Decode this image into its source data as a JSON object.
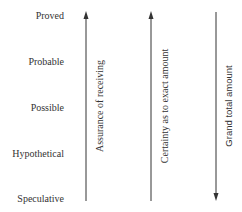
{
  "levels": [
    "Proved",
    "Probable",
    "Possible",
    "Hypothetical",
    "Speculative"
  ],
  "axes": [
    {
      "label": "Assurance of receiving",
      "direction": "up"
    },
    {
      "label": "Certainty as to exact amount",
      "direction": "up"
    },
    {
      "label": "Grand total amount",
      "direction": "down"
    }
  ],
  "colors": {
    "line": "#333333",
    "text": "#333333"
  }
}
